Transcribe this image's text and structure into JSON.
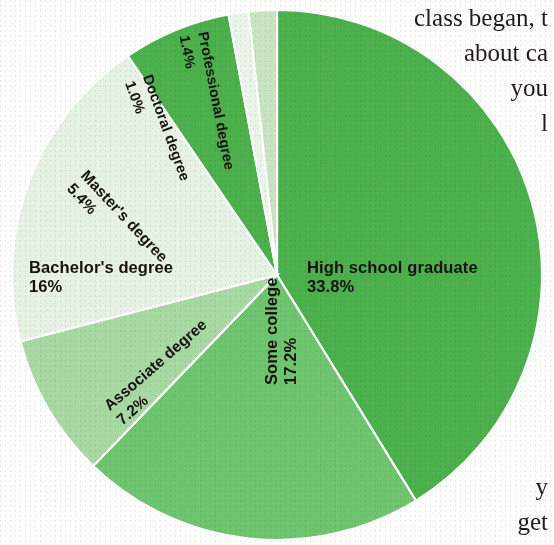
{
  "chart_data": {
    "type": "pie",
    "title": "",
    "categories": [
      "High school graduate",
      "Some college",
      "Associate degree",
      "Bachelor's degree",
      "Master's degree",
      "Doctoral degree",
      "Professional degree"
    ],
    "values": [
      33.8,
      17.2,
      7.2,
      16,
      5.4,
      1.0,
      1.4
    ],
    "value_labels": [
      "33.8%",
      "17.2%",
      "7.2%",
      "16%",
      "5.4%",
      "1.0%",
      "1.4%"
    ],
    "colors": [
      "#4cb04c",
      "#6fc46f",
      "#a8d9a4",
      "#e6f2e4",
      "#4cb04c",
      "#eaf4e8",
      "#c8e4c2"
    ],
    "legend": "none",
    "labels_inside": true,
    "start_angle_deg": 0,
    "direction": "clockwise"
  },
  "slices": [
    {
      "name": "High school graduate",
      "pct": "33.8%",
      "color": "#4cb04c"
    },
    {
      "name": "Some college",
      "pct": "17.2%",
      "color": "#6fc46f"
    },
    {
      "name": "Associate degree",
      "pct": "7.2%",
      "color": "#a8d9a4"
    },
    {
      "name": "Bachelor's degree",
      "pct": "16%",
      "color": "#e6f2e4"
    },
    {
      "name": "Master's degree",
      "pct": "5.4%",
      "color": "#4cb04c"
    },
    {
      "name": "Doctoral degree",
      "pct": "1.0%",
      "color": "#eaf4e8"
    },
    {
      "name": "Professional degree",
      "pct": "1.4%",
      "color": "#c8e4c2"
    }
  ],
  "book_text": {
    "top_lines": [
      "class began, t",
      "about ca",
      "you",
      "l"
    ],
    "bottom_lines": [
      "y",
      "get"
    ]
  },
  "colors": {
    "page_background": "#fdfdfb",
    "slice_outline": "#ffffff",
    "label_text": "#16120e",
    "body_text": "#201c18"
  }
}
